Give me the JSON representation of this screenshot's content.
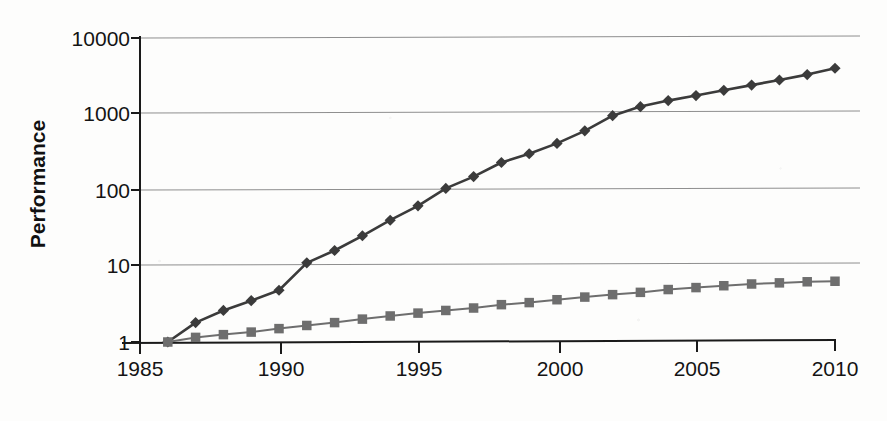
{
  "chart_data": {
    "type": "line",
    "title": "",
    "xlabel": "",
    "ylabel": "Performance",
    "x": [
      1986,
      1987,
      1988,
      1989,
      1990,
      1991,
      1992,
      1993,
      1994,
      1995,
      1996,
      1997,
      1998,
      1999,
      2000,
      2001,
      2002,
      2003,
      2004,
      2005,
      2006,
      2007,
      2008,
      2009,
      2010
    ],
    "xlim": [
      1985,
      2010
    ],
    "ylim": [
      1,
      10000
    ],
    "yscale": "log",
    "grid": true,
    "grid_axis": "y",
    "legend": "none",
    "xticks": [
      "1985",
      "1990",
      "1995",
      "2000",
      "2005",
      "2010"
    ],
    "xtick_values": [
      1985,
      1990,
      1995,
      2000,
      2005,
      2010
    ],
    "yticks": [
      "1",
      "10",
      "100",
      "1000",
      "10000"
    ],
    "ytick_values": [
      1,
      10,
      100,
      1000,
      10000
    ],
    "series": [
      {
        "name": "high-growth-series",
        "marker": "diamond",
        "color": "#3b3b3b",
        "values": [
          1,
          1.8,
          2.6,
          3.5,
          4.8,
          11,
          16,
          25,
          40,
          62,
          105,
          150,
          230,
          300,
          410,
          600,
          950,
          1250,
          1500,
          1750,
          2050,
          2400,
          2800,
          3300,
          4000
        ]
      },
      {
        "name": "low-growth-series",
        "marker": "square",
        "color": "#6e6e6e",
        "values": [
          1,
          1.15,
          1.25,
          1.35,
          1.5,
          1.65,
          1.8,
          2.0,
          2.2,
          2.4,
          2.6,
          2.8,
          3.1,
          3.3,
          3.6,
          3.9,
          4.2,
          4.5,
          4.9,
          5.2,
          5.5,
          5.8,
          6.0,
          6.2,
          6.3
        ]
      }
    ]
  },
  "axes": {
    "y_title": "Performance",
    "y_tick_labels": [
      "10000",
      "1000",
      "100",
      "10",
      "1"
    ],
    "x_tick_labels": [
      "1985",
      "1990",
      "1995",
      "2000",
      "2005",
      "2010"
    ]
  },
  "colors": {
    "axis": "#1a1a1a",
    "grid": "#8a8a8a",
    "series_diamond": "#3b3b3b",
    "series_square": "#6e6e6e",
    "background": "#fdfdfc",
    "text": "#141414"
  }
}
